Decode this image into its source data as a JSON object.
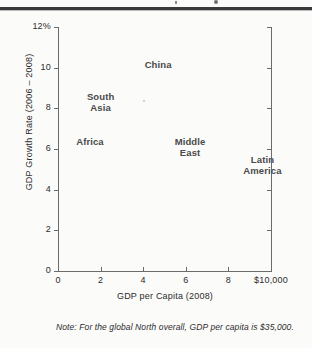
{
  "figure": {
    "note": "Note: For the global North overall, GDP per capita is $35,000."
  },
  "chart_data": {
    "type": "scatter",
    "title": "",
    "xlabel": "GDP per Capita (2008)",
    "ylabel": "GDP Growth Rate (2006 – 2008)",
    "xlim": [
      0,
      10
    ],
    "ylim": [
      0,
      12
    ],
    "grid": false,
    "legend": "none",
    "markers_visible": false,
    "xticks": [
      0,
      2,
      4,
      6,
      8,
      10
    ],
    "xticklabels": [
      "0",
      "2",
      "4",
      "6",
      "8",
      "$10,000"
    ],
    "yticks": [
      0,
      2,
      4,
      6,
      8,
      10,
      12
    ],
    "yticklabels": [
      "0",
      "2",
      "4",
      "6",
      "8",
      "10",
      "12%"
    ],
    "x_unit": "thousands of US dollars",
    "y_unit": "percent",
    "points": [
      {
        "label": "China",
        "x": 4.7,
        "y": 10.2
      },
      {
        "label": "South\nAsia",
        "x": 2.0,
        "y": 8.3
      },
      {
        "label": "Africa",
        "x": 1.5,
        "y": 6.4
      },
      {
        "label": "Middle\nEast",
        "x": 6.2,
        "y": 6.1
      },
      {
        "label": "Latin\nAmerica",
        "x": 9.6,
        "y": 5.2
      }
    ],
    "annotations": [
      "Note: For the global North overall, GDP per capita is $35,000."
    ]
  }
}
